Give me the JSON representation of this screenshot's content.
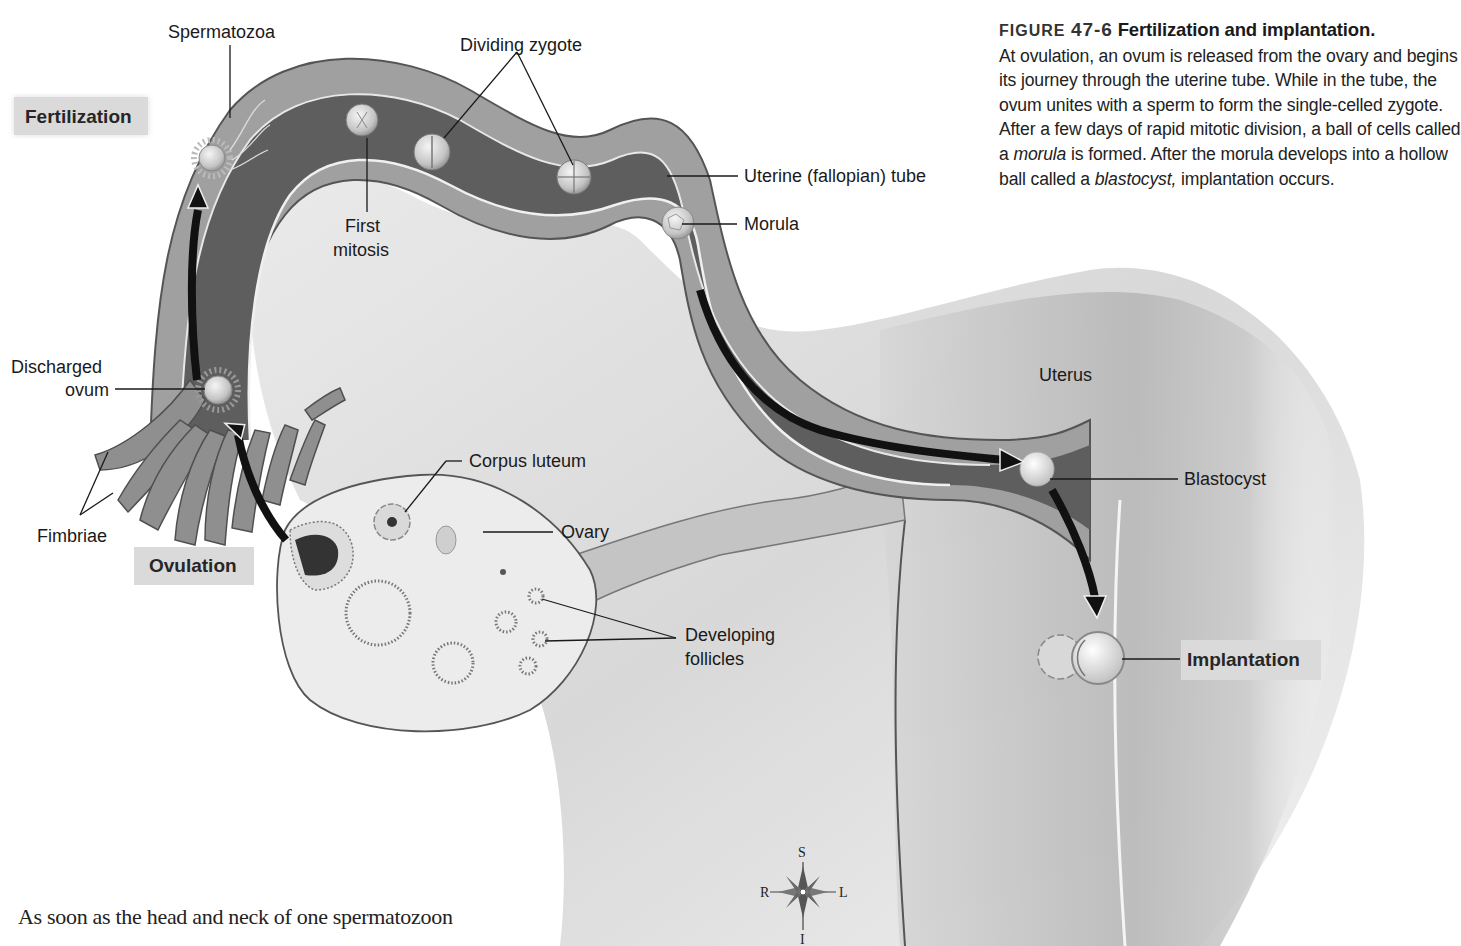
{
  "figure": {
    "number_prefix": "FIGURE",
    "number": "47-6",
    "title": "Fertilization and implantation.",
    "caption_parts": [
      "At ovulation, an ovum is released from the ovary and begins its journey through the uterine tube. While in the tube, the ovum unites with a sperm to form the single-celled zygote. After a few days of rapid mitotic division, a ball of cells called a ",
      "morula",
      " is formed. After the morula develops into a hollow ball called a ",
      "blastocyst,",
      " implantation occurs."
    ]
  },
  "stages": {
    "fertilization": "Fertilization",
    "ovulation": "Ovulation",
    "implantation": "Implantation"
  },
  "labels": {
    "spermatozoa": "Spermatozoa",
    "dividing_zygote": "Dividing zygote",
    "first_mitosis_line1": "First",
    "first_mitosis_line2": "mitosis",
    "uterine_tube": "Uterine (fallopian) tube",
    "morula": "Morula",
    "discharged_ovum_line1": "Discharged",
    "discharged_ovum_line2": "ovum",
    "fimbriae": "Fimbriae",
    "corpus_luteum": "Corpus luteum",
    "ovary": "Ovary",
    "developing_follicles_line1": "Developing",
    "developing_follicles_line2": "follicles",
    "uterus": "Uterus",
    "blastocyst": "Blastocyst"
  },
  "compass": {
    "superior": "S",
    "inferior": "I",
    "right": "R",
    "left": "L"
  },
  "body_text": "As soon as the head and neck of one spermatozoon",
  "colors": {
    "tube_wall": "#9a9a9a",
    "tube_lumen": "#5a5a5a",
    "arrow": "#111111",
    "stage_label_bg": "#d9d9d9",
    "uterus": "#b8b8b8"
  }
}
